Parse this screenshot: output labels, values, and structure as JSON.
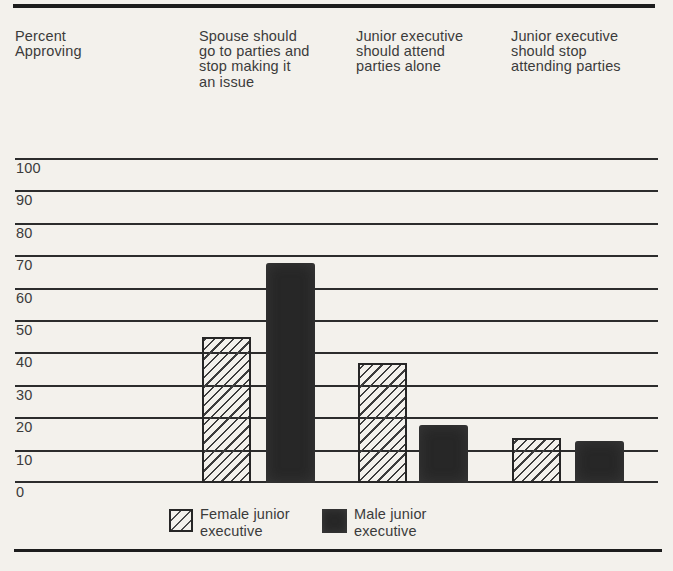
{
  "figure": {
    "background": "#f3f1ec",
    "rule_color": "#1d1d1d",
    "text_color": "#3b3b3b"
  },
  "header": {
    "axis_title": "Percent\nApproving",
    "columns": [
      "Spouse should\ngo to parties and\nstop making it\nan issue",
      "Junior executive\nshould attend\nparties alone",
      "Junior executive\nshould stop\nattending parties"
    ]
  },
  "legend": [
    {
      "label": "Female junior\nexecutive",
      "pattern": "hatched"
    },
    {
      "label": "Male junior\nexecutive",
      "pattern": "solid"
    }
  ],
  "chart_data": {
    "type": "bar",
    "title": "",
    "ylabel": "Percent Approving",
    "ylim": [
      0,
      100
    ],
    "yticks": [
      0,
      10,
      20,
      30,
      40,
      50,
      60,
      70,
      80,
      90,
      100
    ],
    "grid": "horizontal",
    "legend_position": "bottom",
    "categories": [
      "Spouse should go to parties and stop making it an issue",
      "Junior executive should attend parties alone",
      "Junior executive should stop attending parties"
    ],
    "series": [
      {
        "name": "Female junior executive",
        "pattern": "hatched",
        "values": [
          45,
          37,
          14
        ]
      },
      {
        "name": "Male junior executive",
        "pattern": "solid",
        "values": [
          68,
          18,
          13
        ]
      }
    ],
    "colors": {
      "grid": "#2c2c2c",
      "hatch_stroke": "#3c3c3c",
      "solid_fill": "#272727",
      "bar_border": "#262626"
    }
  }
}
